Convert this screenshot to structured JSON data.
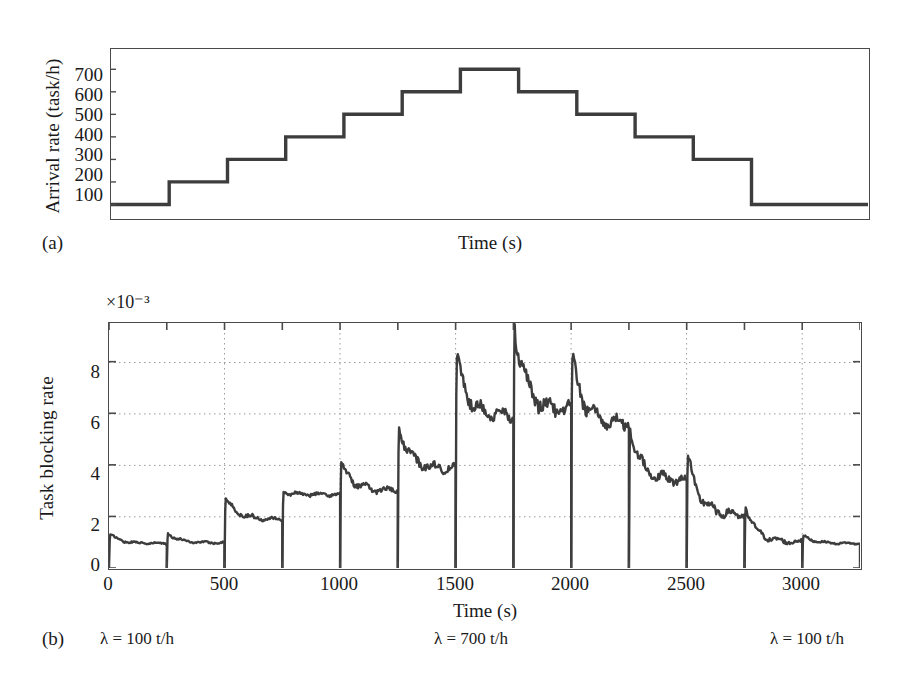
{
  "figure": {
    "background": "#ffffff",
    "line_color": "#3d3d3d",
    "frame_color": "#4a4a4a",
    "grid_color": "#9a9a9a"
  },
  "panel_a": {
    "letter": "(a)",
    "ylabel": "Arrival rate (task/h)",
    "xlabel": "Time (s)",
    "yticks": [
      "700",
      "600",
      "500",
      "400",
      "300",
      "200",
      "100"
    ]
  },
  "panel_b": {
    "letter": "(b)",
    "ylabel": "Task blocking rate",
    "xlabel": "Time (s)",
    "exponent": "×10⁻³",
    "yticks": [
      "8",
      "6",
      "4",
      "2",
      "0"
    ],
    "xticks": [
      "0",
      "500",
      "1000",
      "1500",
      "2000",
      "2500",
      "3000"
    ],
    "annotations": [
      {
        "name": "lambda-left",
        "text": "λ = 100 t/h",
        "x": 100
      },
      {
        "name": "lambda-center",
        "text": "λ = 700 t/h",
        "x": 434
      },
      {
        "name": "lambda-right",
        "text": "λ = 100 t/h",
        "x": 770
      }
    ]
  },
  "chart_data": [
    {
      "type": "line",
      "id": "arrival-rate-staircase",
      "title": "",
      "xlabel": "Time (s)",
      "ylabel": "Arrival rate (task/h)",
      "xlim": [
        0,
        3250
      ],
      "ylim": [
        40,
        790
      ],
      "ytick_values": [
        100,
        200,
        300,
        400,
        500,
        600,
        700
      ],
      "grid": false,
      "drawstyle": "steps-post",
      "x": [
        0,
        250,
        250,
        500,
        500,
        750,
        750,
        1000,
        1000,
        1250,
        1250,
        1500,
        1500,
        1750,
        1750,
        2000,
        2000,
        2250,
        2250,
        2500,
        2500,
        2750,
        2750,
        3250
      ],
      "y": [
        100,
        100,
        200,
        200,
        300,
        300,
        400,
        400,
        500,
        500,
        600,
        600,
        700,
        700,
        600,
        600,
        500,
        500,
        400,
        400,
        300,
        300,
        100,
        100
      ],
      "segments": [
        {
          "t_start": 0,
          "t_end": 250,
          "lambda": 100
        },
        {
          "t_start": 250,
          "t_end": 500,
          "lambda": 200
        },
        {
          "t_start": 500,
          "t_end": 750,
          "lambda": 300
        },
        {
          "t_start": 750,
          "t_end": 1000,
          "lambda": 400
        },
        {
          "t_start": 1000,
          "t_end": 1250,
          "lambda": 500
        },
        {
          "t_start": 1250,
          "t_end": 1500,
          "lambda": 600
        },
        {
          "t_start": 1500,
          "t_end": 1750,
          "lambda": 700
        },
        {
          "t_start": 1750,
          "t_end": 2000,
          "lambda": 600
        },
        {
          "t_start": 2000,
          "t_end": 2250,
          "lambda": 500
        },
        {
          "t_start": 2250,
          "t_end": 2500,
          "lambda": 400
        },
        {
          "t_start": 2500,
          "t_end": 2750,
          "lambda": 300
        },
        {
          "t_start": 2750,
          "t_end": 3250,
          "lambda": 100
        }
      ]
    },
    {
      "type": "line",
      "id": "task-blocking-rate",
      "title": "",
      "xlabel": "Time (s)",
      "ylabel": "Task blocking rate",
      "y_exponent": "×10⁻³",
      "xlim": [
        0,
        3250
      ],
      "ylim": [
        0,
        9.5
      ],
      "xtick_values": [
        0,
        500,
        1000,
        1500,
        2000,
        2500,
        3000
      ],
      "ytick_values": [
        0,
        2,
        4,
        6,
        8
      ],
      "grid": true,
      "note": "values are blocking rate ×10^-3; each 250 s interval restarts from 0 with a transient spike then decays to a plateau",
      "bursts": [
        {
          "t_start": 0,
          "t_end": 250,
          "peak": 1.3,
          "plateau": 0.95
        },
        {
          "t_start": 250,
          "t_end": 500,
          "peak": 1.35,
          "plateau": 0.98
        },
        {
          "t_start": 500,
          "t_end": 750,
          "peak": 2.7,
          "plateau": 1.9
        },
        {
          "t_start": 750,
          "t_end": 1000,
          "peak": 2.95,
          "plateau": 2.85
        },
        {
          "t_start": 1000,
          "t_end": 1250,
          "peak": 4.1,
          "plateau": 3.0
        },
        {
          "t_start": 1250,
          "t_end": 1500,
          "peak": 5.45,
          "plateau": 3.85
        },
        {
          "t_start": 1500,
          "t_end": 1750,
          "peak": 8.15,
          "plateau": 5.9
        },
        {
          "t_start": 1750,
          "t_end": 2000,
          "peak": 9.45,
          "plateau": 6.1
        },
        {
          "t_start": 2000,
          "t_end": 2250,
          "peak": 8.1,
          "plateau": 5.6
        },
        {
          "t_start": 2250,
          "t_end": 2500,
          "peak": 5.4,
          "plateau": 3.4
        },
        {
          "t_start": 2500,
          "t_end": 2750,
          "peak": 4.35,
          "plateau": 2.05
        },
        {
          "t_start": 2750,
          "t_end": 3000,
          "peak": 2.35,
          "plateau": 1.0
        },
        {
          "t_start": 3000,
          "t_end": 3250,
          "peak": 1.25,
          "plateau": 0.95
        }
      ]
    }
  ]
}
